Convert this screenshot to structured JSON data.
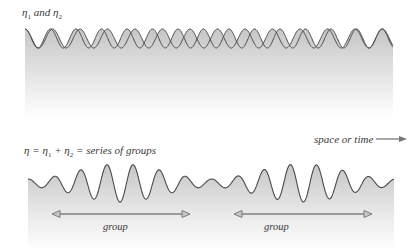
{
  "top_panel": {
    "label": {
      "eta": "η",
      "sub1": "1",
      "conj": "and",
      "sub2": "2"
    },
    "wave1": {
      "wavelength": 25.5,
      "phase": 0
    },
    "wave2": {
      "wavelength": 27.5,
      "phase": 0
    },
    "x_start": 25,
    "x_end": 393,
    "y_mid": 38.5,
    "amplitude": 9.5
  },
  "bottom_panel": {
    "equation": {
      "eta": "η",
      "eq": " = ",
      "eta1": "η",
      "sub1": "1",
      "plus": " + ",
      "eta2": "η",
      "sub2": "2",
      "tail": " = series of groups"
    },
    "axis_label": "space or time",
    "x_start": 28,
    "x_end": 394,
    "y_mid": 183,
    "carrier_wavelength": 26.2,
    "group_period": 182,
    "group_center_1": 120,
    "max_amplitude": 19,
    "min_amplitude": 4,
    "groups": [
      {
        "label": "group",
        "x1": 52,
        "x2": 190
      },
      {
        "label": "group",
        "x1": 234,
        "x2": 372
      }
    ]
  },
  "colors": {
    "line": "#4a4a4a",
    "fill_top": "#c8c8c8",
    "fill_bottom": "#ffffff",
    "arrow": "#7a7a7a"
  }
}
